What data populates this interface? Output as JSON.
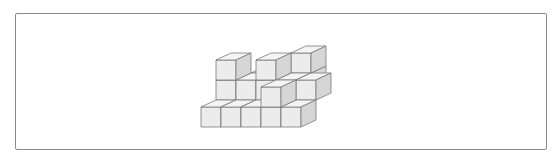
{
  "figure": {
    "corner_label": "",
    "cube_size_px": 21,
    "colors": {
      "top": "#f4f4f4",
      "front": "#ececec",
      "side": "#d6d6d6",
      "edge": "#7a7a7a",
      "frame": "#8a8a8a"
    },
    "cubes": [
      {
        "x": 0,
        "y": 1,
        "z": 1
      },
      {
        "x": 0,
        "y": 1,
        "z": 2
      },
      {
        "x": 3,
        "y": 2,
        "z": 1
      },
      {
        "x": 1,
        "y": 2,
        "z": 1
      },
      {
        "x": 2,
        "y": 2,
        "z": 1
      },
      {
        "x": 3,
        "y": 2,
        "z": 2
      },
      {
        "x": 1,
        "y": 1,
        "z": 1
      },
      {
        "x": 2,
        "y": 1,
        "z": 1
      },
      {
        "x": 2,
        "y": 1,
        "z": 2
      },
      {
        "x": 3,
        "y": 1,
        "z": 1
      },
      {
        "x": 4,
        "y": 1,
        "z": 1
      },
      {
        "x": 0,
        "y": 0,
        "z": 0
      },
      {
        "x": 1,
        "y": 0,
        "z": 0
      },
      {
        "x": 2,
        "y": 0,
        "z": 0
      },
      {
        "x": 3,
        "y": 0,
        "z": 0
      },
      {
        "x": 3,
        "y": 0,
        "z": 1
      },
      {
        "x": 4,
        "y": 0,
        "z": 0
      }
    ]
  }
}
